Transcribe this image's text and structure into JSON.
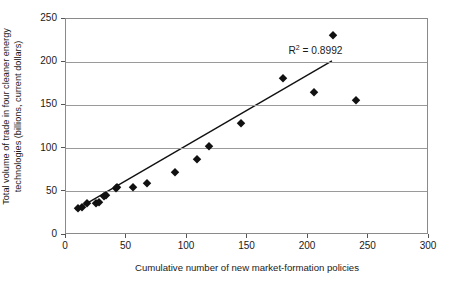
{
  "chart_data": {
    "type": "scatter",
    "title": "",
    "xlabel": "Cumulative number of new market-formation policies",
    "ylabel_line1": "Total volume of trade in four cleaner energy",
    "ylabel_line2": "technologies (billions, current dollars)",
    "xlim": [
      0,
      300
    ],
    "ylim": [
      0,
      250
    ],
    "xticks": [
      0,
      50,
      100,
      150,
      200,
      250,
      300
    ],
    "yticks": [
      0,
      50,
      100,
      150,
      200,
      250
    ],
    "xtick_labels": [
      "0",
      "50",
      "100",
      "150",
      "200",
      "250",
      "300"
    ],
    "ytick_labels": [
      "0",
      "50",
      "100",
      "150",
      "200",
      "250"
    ],
    "grid": "horizontal",
    "legend": "none",
    "marker": "diamond",
    "marker_color": "#111111",
    "grid_color": "#9a9a9a",
    "frame_color": "#8a8a8a",
    "points": [
      {
        "x": 10,
        "y": 31
      },
      {
        "x": 13,
        "y": 32
      },
      {
        "x": 17,
        "y": 37
      },
      {
        "x": 25,
        "y": 37
      },
      {
        "x": 27,
        "y": 38
      },
      {
        "x": 31,
        "y": 45
      },
      {
        "x": 33,
        "y": 46
      },
      {
        "x": 41,
        "y": 54
      },
      {
        "x": 42,
        "y": 55
      },
      {
        "x": 55,
        "y": 56
      },
      {
        "x": 67,
        "y": 60
      },
      {
        "x": 90,
        "y": 73
      },
      {
        "x": 108,
        "y": 88
      },
      {
        "x": 118,
        "y": 103
      },
      {
        "x": 145,
        "y": 130
      },
      {
        "x": 179,
        "y": 182
      },
      {
        "x": 205,
        "y": 165
      },
      {
        "x": 221,
        "y": 231
      },
      {
        "x": 240,
        "y": 156
      }
    ],
    "trendline": {
      "x_start": 8,
      "y_start": 27,
      "x_end": 221,
      "y_end": 201,
      "color": "#111111"
    },
    "annotations": [
      {
        "name": "r-squared",
        "text_prefix": "R",
        "text_sup": "2",
        "text_suffix": " = 0.8992",
        "x": 207,
        "y": 212
      }
    ]
  }
}
